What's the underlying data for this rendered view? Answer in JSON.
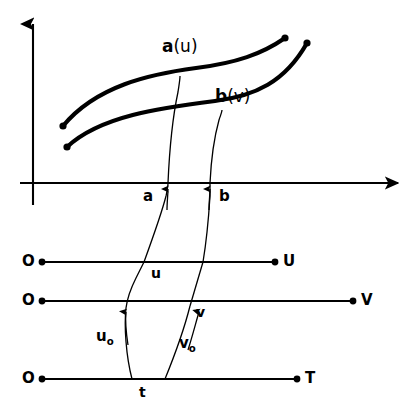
{
  "figure": {
    "type": "mathematical-diagram",
    "background_color": "#ffffff",
    "ink_color": "#000000"
  },
  "axes": {
    "vertical_axis": {
      "name": "y-axis",
      "arrow": "up"
    },
    "horizontal_axis": {
      "name": "x-axis",
      "arrow": "right"
    }
  },
  "curves": {
    "upper": {
      "label": "a(u)",
      "label_bold_part": "a",
      "label_paren_part": "(u)"
    },
    "lower": {
      "label": "b(v)",
      "label_bold_part": "b",
      "label_paren_part": "(v)"
    }
  },
  "axis_labels": {
    "a": "a",
    "b": "b"
  },
  "lines": [
    {
      "name": "u-line",
      "origin_label": "O",
      "end_label": "U",
      "point_label": "u"
    },
    {
      "name": "v-line",
      "origin_label": "O",
      "end_label": "V",
      "point_label": "v"
    },
    {
      "name": "t-line",
      "origin_label": "O",
      "end_label": "T",
      "point_label": "t"
    }
  ],
  "mapping_labels": {
    "u0_base": "u",
    "u0_sub": "o",
    "v0_base": "v",
    "v0_sub": "o"
  }
}
